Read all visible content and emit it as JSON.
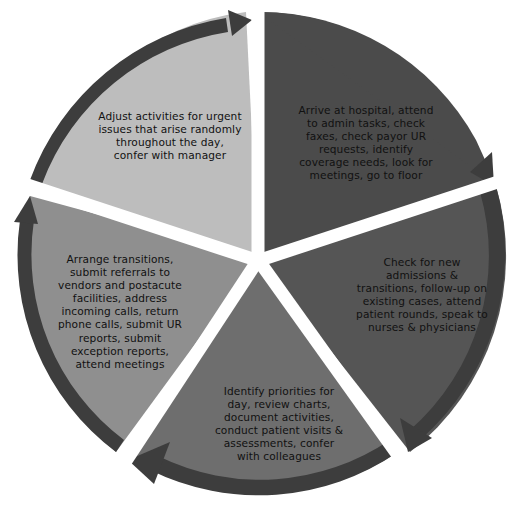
{
  "diagram": {
    "type": "cycle",
    "direction": "clockwise",
    "center": [
      258,
      258
    ],
    "segments": [
      {
        "id": "arrive",
        "label": "Arrive at hospital, attend\nto admin tasks, check\nfaxes, check payor UR\nrequests, identify\ncoverage needs, look for\nmeetings, go to floor",
        "fill": "#4b4b4b",
        "start_deg": 0,
        "end_deg": 72
      },
      {
        "id": "check-admissions",
        "label": "Check for new\nadmissions &\ntransitions, follow-up on\nexisting cases, attend\npatient rounds, speak to\nnurses & physicians",
        "fill": "#555555",
        "start_deg": 72,
        "end_deg": 144
      },
      {
        "id": "identify-priorities",
        "label": "Identify priorities for\nday, review charts,\ndocument activities,\nconduct patient visits &\nassessments, confer\nwith colleagues",
        "fill": "#6e6e6e",
        "start_deg": 144,
        "end_deg": 216
      },
      {
        "id": "arrange-transitions",
        "label": "Arrange transitions,\nsubmit referrals to\nvendors and postacute\nfacilities, address\nincoming calls, return\nphone calls, submit UR\nreports, submit\nexception reports,\nattend meetings",
        "fill": "#8f8f8f",
        "start_deg": 216,
        "end_deg": 288
      },
      {
        "id": "adjust-activities",
        "label": "Adjust activities for urgent\nissues that arise randomly\nthroughout the day,\nconfer with manager",
        "fill": "#bdbdbd",
        "start_deg": 288,
        "end_deg": 360
      }
    ],
    "colors": {
      "arrow_band": "#3d3d3d",
      "gap": "#ffffff",
      "text": "#111111"
    }
  }
}
